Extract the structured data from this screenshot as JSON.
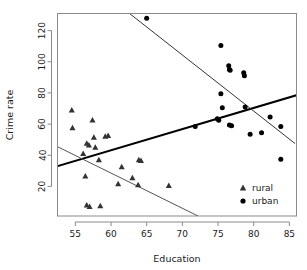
{
  "chart_data": {
    "type": "scatter",
    "title": "",
    "xlabel": "Education",
    "ylabel": "Crime rate",
    "xlim": [
      52.5,
      86.0
    ],
    "ylim": [
      1.0,
      131.0
    ],
    "xticks": [
      55,
      60,
      65,
      70,
      75,
      80,
      85
    ],
    "yticks": [
      20,
      40,
      60,
      80,
      100,
      120
    ],
    "grid": false,
    "legend_position": "bottom-right",
    "series": [
      {
        "name": "rural",
        "marker": "triangle",
        "color": "#333333",
        "points": [
          [
            54.5,
            69.0
          ],
          [
            54.6,
            57.5
          ],
          [
            56.1,
            41.0
          ],
          [
            56.4,
            26.5
          ],
          [
            56.6,
            47.5
          ],
          [
            56.9,
            46.5
          ],
          [
            56.6,
            8.0
          ],
          [
            57.0,
            7.0
          ],
          [
            57.4,
            62.5
          ],
          [
            57.6,
            51.5
          ],
          [
            57.8,
            45.0
          ],
          [
            58.3,
            37.0
          ],
          [
            58.5,
            7.5
          ],
          [
            59.2,
            52.0
          ],
          [
            59.6,
            52.5
          ],
          [
            61.0,
            21.5
          ],
          [
            61.5,
            32.5
          ],
          [
            63.0,
            25.5
          ],
          [
            63.8,
            21.0
          ],
          [
            63.9,
            37.0
          ],
          [
            64.2,
            36.5
          ],
          [
            68.1,
            20.5
          ]
        ]
      },
      {
        "name": "urban",
        "marker": "circle",
        "color": "#000000",
        "points": [
          [
            65.0,
            128.0
          ],
          [
            71.8,
            58.5
          ],
          [
            74.9,
            63.5
          ],
          [
            75.1,
            62.5
          ],
          [
            75.4,
            110.5
          ],
          [
            75.4,
            79.5
          ],
          [
            75.6,
            70.5
          ],
          [
            76.5,
            97.5
          ],
          [
            76.6,
            95.0
          ],
          [
            76.7,
            94.5
          ],
          [
            76.6,
            59.5
          ],
          [
            76.9,
            59.0
          ],
          [
            78.6,
            93.0
          ],
          [
            78.7,
            91.0
          ],
          [
            78.8,
            71.0
          ],
          [
            79.5,
            53.5
          ],
          [
            81.1,
            54.5
          ],
          [
            82.3,
            64.5
          ],
          [
            83.8,
            58.5
          ],
          [
            83.8,
            37.5
          ]
        ]
      }
    ],
    "trend_lines": [
      {
        "name": "urban-trend",
        "series": "urban",
        "weight": "thick",
        "color": "#000000",
        "x0": 52.5,
        "y0": 33.0,
        "x1": 86.0,
        "y1": 78.5
      },
      {
        "name": "rural-trend",
        "series": "rural",
        "weight": "thin",
        "color": "#555555",
        "x0": 52.5,
        "y0": 45.5,
        "x1": 72.2,
        "y1": 1.0
      },
      {
        "name": "overall-trend",
        "series": "all",
        "weight": "thin",
        "color": "#333333",
        "x0": 62.6,
        "y0": 131.0,
        "x1": 85.8,
        "y1": 47.5
      }
    ]
  },
  "legend": {
    "entries": [
      {
        "label": "rural",
        "marker": "triangle"
      },
      {
        "label": "urban",
        "marker": "circle"
      }
    ]
  },
  "axes": {
    "x_title": "Education",
    "y_title": "Crime rate",
    "x_tick_labels": [
      "55",
      "60",
      "65",
      "70",
      "75",
      "80",
      "85"
    ],
    "y_tick_labels": [
      "20",
      "40",
      "60",
      "80",
      "100",
      "120"
    ]
  }
}
